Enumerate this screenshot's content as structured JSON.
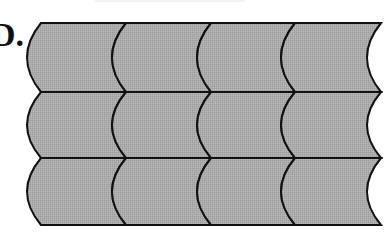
{
  "figure": {
    "label": "D.",
    "rows": 3,
    "columns": 4,
    "column_corners_x": [
      41,
      126,
      211,
      295,
      381
    ],
    "row_edges_y": [
      23,
      92,
      158,
      225
    ],
    "bulge_depth": 14,
    "colors": {
      "fill": "#a9a9a9",
      "fill_alt": "#b2b2b2",
      "stroke": "#111111",
      "background": "#ffffff"
    }
  }
}
